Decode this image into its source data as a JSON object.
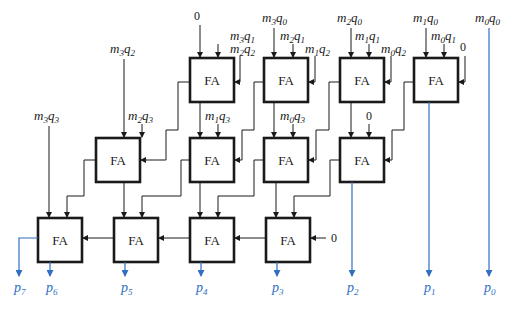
{
  "diagram": {
    "cell_label": "FA",
    "colors": {
      "wire": "#1a1a1a",
      "output": "#2f6fc4",
      "box_border": "#1a1a1a"
    },
    "constant_zero": "0",
    "row1": [
      {
        "id": "fa-r1-c3",
        "in_top_left": "0",
        "in_top_right": "m3q1",
        "in_right": "m2q2"
      },
      {
        "id": "fa-r1-c2",
        "in_top_left": "m3q0",
        "in_top_right": "m2q1",
        "in_right": "m1q2"
      },
      {
        "id": "fa-r1-c1",
        "in_top_left": "m2q0",
        "in_top_right": "m1q1",
        "in_right": "m0q2"
      },
      {
        "id": "fa-r1-c0",
        "in_top_left": "m1q0",
        "in_top_right": "m0q1",
        "in_right": "0"
      }
    ],
    "row2": [
      {
        "id": "fa-r2-c3",
        "in_top_left": "m3q2",
        "in_top_right": "m2q3"
      },
      {
        "id": "fa-r2-c2",
        "in_top_right": "m1q3"
      },
      {
        "id": "fa-r2-c1",
        "in_top_right": "m0q3"
      },
      {
        "id": "fa-r2-c0",
        "in_top_right": "0"
      }
    ],
    "row3": [
      {
        "id": "fa-r3-c3",
        "in_top_left": "m3q3"
      },
      {
        "id": "fa-r3-c2"
      },
      {
        "id": "fa-r3-c1"
      },
      {
        "id": "fa-r3-c0",
        "in_right": "0"
      }
    ],
    "direct_input": "m0q0",
    "outputs": [
      "p7",
      "p6",
      "p5",
      "p4",
      "p3",
      "p2",
      "p1",
      "p0"
    ]
  }
}
